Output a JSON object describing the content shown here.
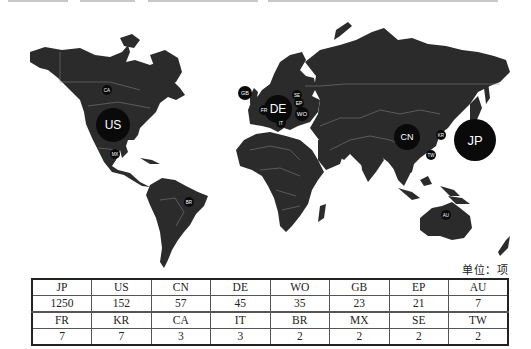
{
  "unit_label": "单位：项",
  "chart_data": {
    "type": "bubble-map",
    "title": "",
    "unit": "项",
    "legend": [],
    "series": [
      {
        "code": "JP",
        "value": 1250,
        "x": 475,
        "y": 140,
        "r": 21,
        "fs": 13
      },
      {
        "code": "US",
        "value": 152,
        "x": 113,
        "y": 125,
        "r": 17,
        "fs": 12
      },
      {
        "code": "CN",
        "value": 57,
        "x": 407,
        "y": 137,
        "r": 13,
        "fs": 9
      },
      {
        "code": "DE",
        "value": 45,
        "x": 278,
        "y": 109,
        "r": 14,
        "fs": 12
      },
      {
        "code": "WO",
        "value": 35,
        "x": 302,
        "y": 114,
        "r": 7,
        "fs": 6
      },
      {
        "code": "GB",
        "value": 23,
        "x": 245,
        "y": 93,
        "r": 7,
        "fs": 5.5
      },
      {
        "code": "EP",
        "value": 21,
        "x": 299,
        "y": 103,
        "r": 5,
        "fs": 5
      },
      {
        "code": "AU",
        "value": 7,
        "x": 446,
        "y": 215,
        "r": 5,
        "fs": 4.5
      },
      {
        "code": "FR",
        "value": 7,
        "x": 264,
        "y": 110,
        "r": 5,
        "fs": 5
      },
      {
        "code": "KR",
        "value": 7,
        "x": 441,
        "y": 135,
        "r": 5,
        "fs": 4.5
      },
      {
        "code": "CA",
        "value": 3,
        "x": 107,
        "y": 90,
        "r": 5,
        "fs": 4.5
      },
      {
        "code": "IT",
        "value": 3,
        "x": 281,
        "y": 123,
        "r": 5,
        "fs": 4.5
      },
      {
        "code": "BR",
        "value": 2,
        "x": 189,
        "y": 202,
        "r": 5,
        "fs": 4.5
      },
      {
        "code": "MX",
        "value": 2,
        "x": 115,
        "y": 154,
        "r": 5,
        "fs": 4.5
      },
      {
        "code": "SE",
        "value": 2,
        "x": 297,
        "y": 95,
        "r": 5,
        "fs": 4.5
      },
      {
        "code": "TW",
        "value": 2,
        "x": 431,
        "y": 155,
        "r": 5,
        "fs": 4.5
      }
    ],
    "categories": [
      "JP",
      "US",
      "CN",
      "DE",
      "WO",
      "GB",
      "EP",
      "AU",
      "FR",
      "KR",
      "CA",
      "IT",
      "BR",
      "MX",
      "SE",
      "TW"
    ],
    "values": [
      1250,
      152,
      57,
      45,
      35,
      23,
      21,
      7,
      7,
      7,
      3,
      3,
      2,
      2,
      2,
      2
    ]
  },
  "table": {
    "rows": [
      [
        "JP",
        "US",
        "CN",
        "DE",
        "WO",
        "GB",
        "EP",
        "AU"
      ],
      [
        "1250",
        "152",
        "57",
        "45",
        "35",
        "23",
        "21",
        "7"
      ],
      [
        "FR",
        "KR",
        "CA",
        "IT",
        "BR",
        "MX",
        "SE",
        "TW"
      ],
      [
        "7",
        "7",
        "3",
        "3",
        "2",
        "2",
        "2",
        "2"
      ]
    ]
  }
}
